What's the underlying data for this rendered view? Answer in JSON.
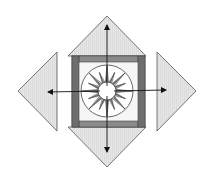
{
  "diagram": {
    "title": "",
    "colors": {
      "background": "#ffffff",
      "triangle_fill": "#e4e4e4",
      "triangle_stroke": "#555555",
      "frame_dark": "#6e6e6e",
      "frame_light": "#8a8a8a",
      "block_bg": "#f6f6f6",
      "star_dark": "#7a7a7a",
      "star_light": "#b4b4b4",
      "circle_stroke": "#444444",
      "center_fill": "#ffffff",
      "arrow": "#111111"
    },
    "center_block": {
      "label": "compass-star-block",
      "cx": 107,
      "cy": 91
    },
    "star": {
      "points": 16
    },
    "triangles": [
      {
        "name": "top-triangle",
        "direction": "up"
      },
      {
        "name": "right-triangle",
        "direction": "right"
      },
      {
        "name": "bottom-triangle",
        "direction": "down"
      },
      {
        "name": "left-triangle",
        "direction": "left"
      }
    ],
    "arrows": [
      {
        "name": "arrow-up"
      },
      {
        "name": "arrow-right"
      },
      {
        "name": "arrow-down"
      },
      {
        "name": "arrow-left"
      }
    ]
  }
}
